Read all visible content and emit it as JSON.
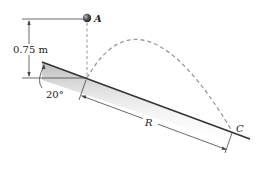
{
  "diagram": {
    "point_A_label": "A",
    "point_C_label": "C",
    "height_label": "0.75 m",
    "angle_label": "20°",
    "range_label": "R",
    "colors": {
      "ink": "#333333",
      "trajectory": "#9a9a9a",
      "ball": "#555555",
      "incline_shade": "#cfcfcf"
    }
  }
}
